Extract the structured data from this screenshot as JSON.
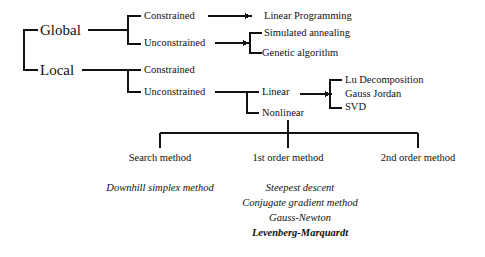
{
  "diagram": {
    "line_color": "#111111",
    "text_color": "#111111",
    "background": "#ffffff",
    "root_branches": [
      {
        "label": "Global"
      },
      {
        "label": "Local"
      }
    ],
    "global_children": [
      {
        "label": "Constrained"
      },
      {
        "label": "Unconstrained"
      }
    ],
    "local_children": [
      {
        "label": "Constrained"
      },
      {
        "label": "Unconstrained"
      }
    ],
    "global_constrained_results": [
      {
        "label": "Linear Programming"
      }
    ],
    "global_unconstrained_results": [
      {
        "label": "Simulated annealing"
      },
      {
        "label": "Genetic algorithm"
      }
    ],
    "local_unconstrained_children": [
      {
        "label": "Linear"
      },
      {
        "label": "Nonlinear"
      }
    ],
    "linear_results": [
      {
        "label": "Lu Decomposition"
      },
      {
        "label": "Gauss Jordan"
      },
      {
        "label": "SVD"
      }
    ],
    "nonlinear_columns": [
      {
        "label": "Search method"
      },
      {
        "label": "1st order method"
      },
      {
        "label": "2nd order method"
      }
    ],
    "search_methods": [
      {
        "label": "Downhill simplex method",
        "emphasis": false
      }
    ],
    "first_order_methods": [
      {
        "label": "Steepest descent",
        "emphasis": false
      },
      {
        "label": "Conjugate gradient method",
        "emphasis": false
      },
      {
        "label": "Gauss-Newton",
        "emphasis": false
      },
      {
        "label": "Levenberg-Marquardt",
        "emphasis": true
      }
    ],
    "second_order_methods": []
  }
}
